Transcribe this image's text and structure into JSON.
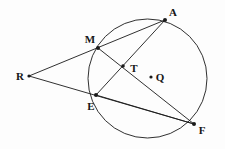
{
  "figure": {
    "width": 225,
    "height": 149,
    "background_color": "#fdfdfd",
    "stroke_color": "#1a1a1a",
    "label_color": "#161616",
    "stroke_width": 0.9
  },
  "circle": {
    "name": "circle-q",
    "center_x": 147.5,
    "center_y": 78.5,
    "radius": 59.5
  },
  "points": [
    {
      "id": "A",
      "label": "A",
      "x": 165,
      "y": 20,
      "label_x": 173,
      "label_y": 12,
      "dot": true,
      "dot_r": 2.0
    },
    {
      "id": "M",
      "label": "M",
      "x": 98,
      "y": 48,
      "label_x": 90,
      "label_y": 39,
      "dot": true,
      "dot_r": 2.0
    },
    {
      "id": "R",
      "label": "R",
      "x": 29,
      "y": 76,
      "label_x": 20,
      "label_y": 76,
      "dot": true,
      "dot_r": 1.6
    },
    {
      "id": "E",
      "label": "E",
      "x": 96,
      "y": 95,
      "label_x": 91,
      "label_y": 106,
      "dot": true,
      "dot_r": 2.0
    },
    {
      "id": "F",
      "label": "F",
      "x": 194,
      "y": 124,
      "label_x": 202,
      "label_y": 130,
      "dot": true,
      "dot_r": 2.0
    },
    {
      "id": "T",
      "label": "T",
      "x": 123,
      "y": 66,
      "label_x": 134,
      "label_y": 68,
      "dot": true,
      "dot_r": 1.8
    },
    {
      "id": "Q",
      "label": "Q",
      "x": 151,
      "y": 77,
      "label_x": 160,
      "label_y": 77,
      "dot": true,
      "dot_r": 1.6
    }
  ],
  "segments": [
    {
      "name": "secant-r-m-a",
      "from": "R",
      "to": "A",
      "x1": 29,
      "y1": 76,
      "x2": 165,
      "y2": 20
    },
    {
      "name": "secant-r-e-f",
      "from": "R",
      "to": "F",
      "x1": 29,
      "y1": 76,
      "x2": 194,
      "y2": 124
    },
    {
      "name": "chord-m-f",
      "from": "M",
      "to": "F",
      "x1": 98,
      "y1": 48,
      "x2": 194,
      "y2": 124
    },
    {
      "name": "chord-e-a",
      "from": "E",
      "to": "A",
      "x1": 96,
      "y1": 95,
      "x2": 165,
      "y2": 20
    },
    {
      "name": "chord-e-f",
      "from": "E",
      "to": "F",
      "x1": 96,
      "y1": 95,
      "x2": 194,
      "y2": 124
    }
  ]
}
